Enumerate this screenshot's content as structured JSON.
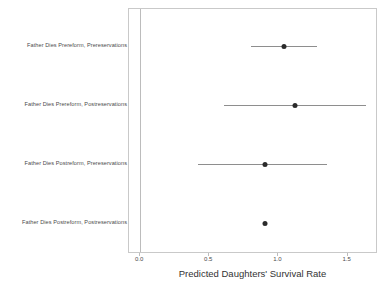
{
  "chart_data": {
    "type": "scatter",
    "title": "",
    "subtitle": "",
    "xlabel": "Predicted Daughters' Survival Rate",
    "ylabel": "",
    "xlim": [
      -0.08,
      1.72
    ],
    "ylim": [
      0,
      4
    ],
    "grid": false,
    "legend": null,
    "orientation": "horizontal",
    "xticks": [
      {
        "value": 0.0,
        "label": "0.0"
      },
      {
        "value": 0.5,
        "label": "0.5"
      },
      {
        "value": 1.0,
        "label": "1.0"
      },
      {
        "value": 1.5,
        "label": "1.5"
      }
    ],
    "reference_line": {
      "value": 0.0,
      "visible": true
    },
    "categories": [
      "Father Dies Prereform, Prereservations",
      "Father Dies Prereform, Postreservations",
      "Father Dies Postreform, Prereservations",
      "Father Dies Postreform, Postreservations"
    ],
    "values": [
      1.04,
      1.12,
      0.9,
      0.9
    ],
    "ci_low": [
      0.8,
      0.61,
      0.42,
      null
    ],
    "ci_high": [
      1.28,
      1.63,
      1.35,
      null
    ],
    "points": [
      {
        "category": "Father Dies Prereform, Prereservations",
        "estimate": 1.04,
        "ci_low": 0.8,
        "ci_high": 1.28
      },
      {
        "category": "Father Dies Prereform, Postreservations",
        "estimate": 1.12,
        "ci_low": 0.61,
        "ci_high": 1.63
      },
      {
        "category": "Father Dies Postreform, Prereservations",
        "estimate": 0.9,
        "ci_low": 0.42,
        "ci_high": 1.35
      },
      {
        "category": "Father Dies Postreform, Postreservations",
        "estimate": 0.9,
        "ci_low": null,
        "ci_high": null
      }
    ],
    "colors": {
      "point": "#2b2b2b",
      "interval": "#8e8e8e",
      "frame": "#c9c9c9",
      "reference": "#bcbcbc",
      "text": "#4b4b4b",
      "background": "#ffffff"
    }
  }
}
